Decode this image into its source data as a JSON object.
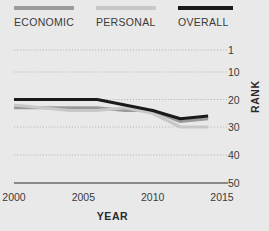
{
  "chart_data": {
    "type": "line",
    "title": "",
    "subtitle": "",
    "xlabel": "YEAR",
    "ylabel": "RANK",
    "xlim": [
      2000,
      2015
    ],
    "ylim": [
      1,
      50
    ],
    "y_inverted": true,
    "grid": true,
    "grid_style": "dotted-horizontal",
    "legend_position": "top",
    "xticks": [
      2000,
      2005,
      2010,
      2015
    ],
    "xtick_labels": [
      "2000",
      "2005",
      "2010",
      "2015"
    ],
    "yticks": [
      1,
      10,
      20,
      30,
      40,
      50
    ],
    "ytick_labels": [
      "1",
      "10",
      "20",
      "30",
      "40",
      "50"
    ],
    "x": [
      2000,
      2002,
      2004,
      2006,
      2008,
      2010,
      2012,
      2014
    ],
    "series": [
      {
        "name": "ECONOMIC",
        "color": "#9a9a9a",
        "values": [
          23,
          23,
          23,
          23,
          24,
          24,
          28,
          27
        ]
      },
      {
        "name": "PERSONAL",
        "color": "#c8c8c8",
        "values": [
          22,
          23,
          24,
          24,
          23,
          25,
          30,
          30
        ]
      },
      {
        "name": "OVERALL",
        "color": "#1a1a1a",
        "values": [
          20,
          20,
          20,
          20,
          22,
          24,
          27,
          26
        ]
      }
    ]
  },
  "legend": {
    "items": [
      {
        "label": "ECONOMIC",
        "color": "#9a9a9a"
      },
      {
        "label": "PERSONAL",
        "color": "#c8c8c8"
      },
      {
        "label": "OVERALL",
        "color": "#1a1a1a"
      }
    ]
  },
  "axes": {
    "x_title": "YEAR",
    "y_title": "RANK",
    "x_labels": [
      "2000",
      "2005",
      "2010",
      "2015"
    ],
    "y_labels": [
      "1",
      "10",
      "20",
      "30",
      "40",
      "50"
    ]
  },
  "colors": {
    "background": "#e9e9e9",
    "axis_line": "#6a6a6a",
    "gridline": "#b0b0b0",
    "text": "#3a3a3a"
  }
}
